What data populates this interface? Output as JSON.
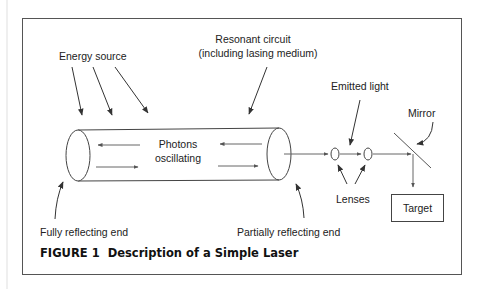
{
  "figure": {
    "caption_number": "FIGURE 1",
    "caption_title": "Description of a Simple Laser"
  },
  "labels": {
    "energy_source": "Energy source",
    "resonant_circuit_line1": "Resonant circuit",
    "resonant_circuit_line2": "(including lasing medium)",
    "photons_line1": "Photons",
    "photons_line2": "oscillating",
    "emitted_light": "Emitted light",
    "mirror": "Mirror",
    "lenses": "Lenses",
    "target": "Target",
    "fully_reflecting_end": "Fully reflecting end",
    "partially_reflecting_end": "Partially reflecting end"
  },
  "colors": {
    "stroke": "#333333",
    "frame": "#555555",
    "text": "#222222"
  }
}
